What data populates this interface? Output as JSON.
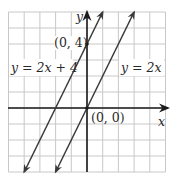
{
  "chart_data": {
    "type": "line",
    "title": "",
    "xlabel": "x",
    "ylabel": "y",
    "xlim": [
      -5,
      5
    ],
    "ylim": [
      -4,
      6
    ],
    "grid": true,
    "grid_step": 1,
    "series": [
      {
        "name": "y = 2x + 4",
        "slope": 2,
        "intercept": 4,
        "x": [
          -4,
          1
        ],
        "y": [
          -4,
          6
        ],
        "arrows": "both"
      },
      {
        "name": "y = 2x",
        "slope": 2,
        "intercept": 0,
        "x": [
          -2,
          3
        ],
        "y": [
          -4,
          6
        ],
        "arrows": "both"
      }
    ],
    "points": [
      {
        "label": "(0, 4)",
        "x": 0,
        "y": 4
      },
      {
        "label": "(0, 0)",
        "x": 0,
        "y": 0
      }
    ]
  },
  "labels": {
    "axis_x": "x",
    "axis_y": "y",
    "line1": "y = 2x + 4",
    "line2": "y = 2x",
    "point_0_4": "(0, 4)",
    "point_0_0": "(0, 0)"
  },
  "colors": {
    "grid": "#c8c8c8",
    "axis": "#1a1a1a",
    "line": "#3a3a3a",
    "text": "#2a2a2a"
  }
}
